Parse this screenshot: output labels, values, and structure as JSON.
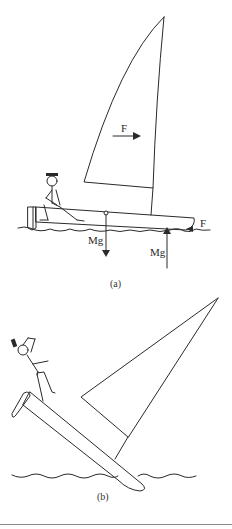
{
  "figure": {
    "panels": [
      {
        "caption": "(a)",
        "description": "Dinghy sailing upright with sailor sitting on the deck",
        "labels": {
          "sail_force": "F",
          "keel_force": "F",
          "weight_down": "Mg",
          "buoyancy_up": "Mg"
        }
      },
      {
        "caption": "(b)",
        "description": "Dinghy capsizing, sailor falling off the hull"
      }
    ]
  }
}
